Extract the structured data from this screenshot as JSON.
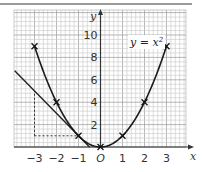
{
  "chart_data": {
    "type": "line",
    "title": "",
    "xlabel": "x",
    "ylabel": "y",
    "xlim": [
      -3.9,
      3.9
    ],
    "ylim": [
      0,
      12.2
    ],
    "grid": true,
    "x_ticks": [
      -3,
      -2,
      -1,
      0,
      1,
      2,
      3
    ],
    "x_tick_labels": [
      "−3",
      "−2",
      "−1",
      "O",
      "1",
      "2",
      "3"
    ],
    "y_ticks": [
      2,
      4,
      6,
      8,
      10
    ],
    "y_tick_labels": [
      "2",
      "4",
      "6",
      "8",
      "10"
    ],
    "series": [
      {
        "name": "y = x²",
        "kind": "curve",
        "x": [
          -3,
          -2,
          -1,
          0,
          1,
          2,
          3
        ],
        "y": [
          9,
          4,
          1,
          0,
          1,
          4,
          9
        ],
        "markers": "x"
      },
      {
        "name": "tangent at x = -1",
        "kind": "line",
        "equation": "y = -2x - 1",
        "x": [
          -3.9,
          -0.5
        ],
        "y": [
          6.8,
          0
        ]
      }
    ],
    "annotations": [
      {
        "type": "label",
        "text": "y = x²",
        "at": [
          2.1,
          9
        ]
      },
      {
        "type": "dashed",
        "from": [
          -3,
          1
        ],
        "to": [
          -3,
          5
        ],
        "note": "vertical rise"
      },
      {
        "type": "dashed",
        "from": [
          -3,
          1
        ],
        "to": [
          -1,
          1
        ],
        "note": "horizontal run"
      }
    ]
  },
  "labels": {
    "equation_prefix": "y = x",
    "equation_exp": "2",
    "x_axis": "x",
    "y_axis": "y",
    "ticks_x": [
      "−3",
      "−2",
      "−1",
      "O",
      "1",
      "2",
      "3"
    ],
    "ticks_y": [
      "2",
      "4",
      "6",
      "8",
      "10"
    ]
  }
}
